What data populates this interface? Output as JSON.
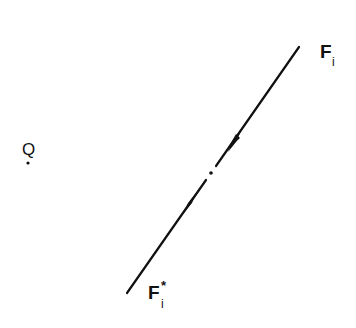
{
  "diagram": {
    "labels": {
      "point_q": "Q",
      "line_top_main": "F",
      "line_top_sub": "i",
      "line_bottom_main": "F",
      "line_bottom_sup": "*",
      "line_bottom_sub": "i"
    },
    "colors": {
      "ink": "#111111",
      "background": "#ffffff"
    },
    "geometry": {
      "line_start": [
        127,
        293
      ],
      "line_end": [
        299,
        47
      ],
      "center_point": [
        211,
        173
      ],
      "center_gap": true,
      "arrows": "two arrowheads on the line pointing toward the center point",
      "point_q": [
        28,
        163
      ]
    }
  }
}
